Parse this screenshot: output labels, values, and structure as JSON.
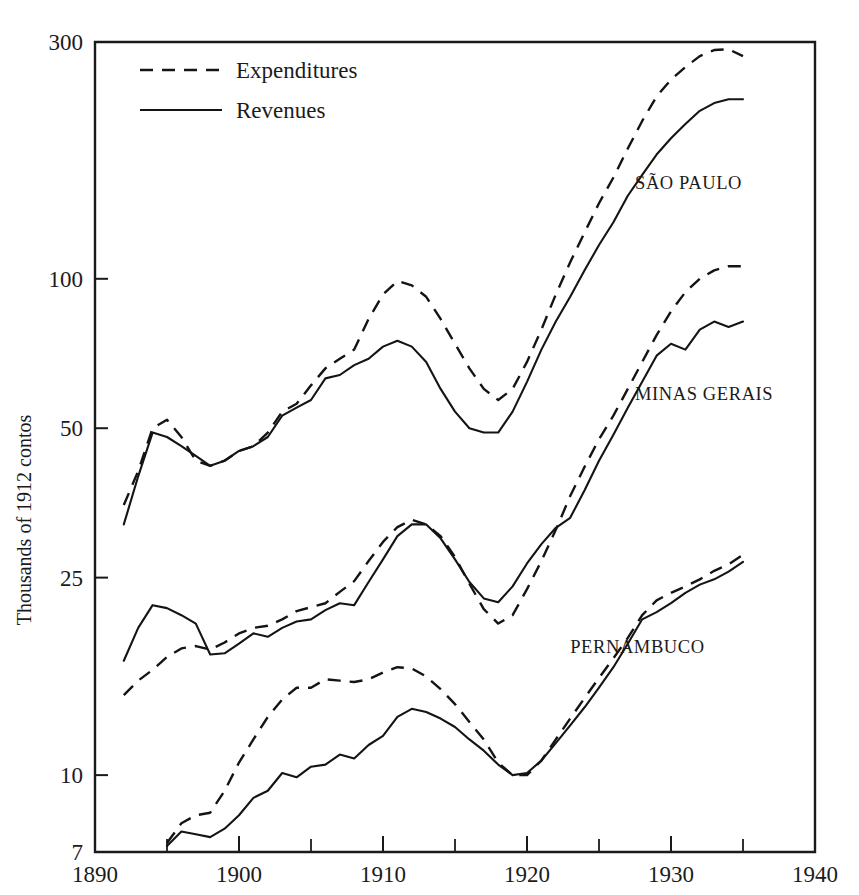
{
  "chart_data": {
    "type": "line",
    "title": "",
    "xlabel": "",
    "ylabel": "Thousands of 1912 contos",
    "xlim": [
      1890,
      1940
    ],
    "ylim": [
      7,
      300
    ],
    "yscale": "log",
    "grid": false,
    "legend_position": "top-left inside",
    "x_ticks": [
      "1890",
      "1900",
      "1910",
      "1920",
      "1930",
      "1940"
    ],
    "x_tick_values": [
      1890,
      1900,
      1910,
      1920,
      1930,
      1940
    ],
    "x_minor_tick_values": [
      1895,
      1905,
      1915,
      1925,
      1935
    ],
    "y_ticks": [
      "300",
      "100",
      "50",
      "25",
      "10",
      "7"
    ],
    "y_tick_values": [
      300,
      100,
      50,
      25,
      10,
      7
    ],
    "legend": [
      {
        "label": "Expenditures",
        "style": "dashed"
      },
      {
        "label": "Revenues",
        "style": "solid"
      }
    ],
    "group_labels": [
      {
        "text": "SÃO PAULO",
        "x": 1927.5,
        "y": 152
      },
      {
        "text": "MINAS GERAIS",
        "x": 1927.5,
        "y": 57
      },
      {
        "text": "PERNAMBUCO",
        "x": 1923.0,
        "y": 17.6
      }
    ],
    "series": [
      {
        "name": "SÃO PAULO Expenditures",
        "group": "SÃO PAULO",
        "style": "dashed",
        "x": [
          1892,
          1893,
          1894,
          1895,
          1896,
          1897,
          1898,
          1899,
          1900,
          1901,
          1902,
          1903,
          1904,
          1905,
          1906,
          1907,
          1908,
          1909,
          1910,
          1911,
          1912,
          1913,
          1914,
          1915,
          1916,
          1917,
          1918,
          1919,
          1920,
          1921,
          1922,
          1923,
          1924,
          1925,
          1926,
          1927,
          1928,
          1929,
          1930,
          1931,
          1932,
          1933,
          1934,
          1935
        ],
        "y": [
          35,
          41,
          50,
          52,
          48,
          43,
          42,
          43,
          45,
          46,
          49,
          54,
          56,
          61,
          66,
          69,
          72,
          83,
          93,
          99,
          97,
          92,
          83,
          74,
          66,
          60,
          57,
          60,
          68,
          79,
          93,
          108,
          124,
          142,
          160,
          183,
          208,
          233,
          252,
          267,
          281,
          289,
          290,
          281
        ],
        "notes": "Top band, dashed. Peak ~99 in 1911, trough ~57 in 1918, peak ~290 in 1934."
      },
      {
        "name": "SÃO PAULO Revenues",
        "group": "SÃO PAULO",
        "style": "solid",
        "x": [
          1892,
          1893,
          1894,
          1895,
          1896,
          1897,
          1898,
          1899,
          1900,
          1901,
          1902,
          1903,
          1904,
          1905,
          1906,
          1907,
          1908,
          1909,
          1910,
          1911,
          1912,
          1913,
          1914,
          1915,
          1916,
          1917,
          1918,
          1919,
          1920,
          1921,
          1922,
          1923,
          1924,
          1925,
          1926,
          1927,
          1928,
          1929,
          1930,
          1931,
          1932,
          1933,
          1934,
          1935
        ],
        "y": [
          32,
          40,
          49,
          48,
          46,
          44,
          42,
          43,
          45,
          46,
          48,
          53,
          55,
          57,
          63,
          64,
          67,
          69,
          73,
          75,
          73,
          68,
          60,
          54,
          50,
          49,
          49,
          54,
          62,
          72,
          82,
          92,
          104,
          117,
          130,
          147,
          162,
          178,
          192,
          205,
          218,
          226,
          230,
          230
        ],
        "notes": "Top band, solid. Peak ~75 in 1911, trough ~49 in 1917-1918, ends ~230."
      },
      {
        "name": "MINAS GERAIS Expenditures",
        "group": "MINAS GERAIS",
        "style": "dashed",
        "x": [
          1892,
          1893,
          1894,
          1895,
          1896,
          1897,
          1898,
          1899,
          1900,
          1901,
          1902,
          1903,
          1904,
          1905,
          1906,
          1907,
          1908,
          1909,
          1910,
          1911,
          1912,
          1913,
          1914,
          1915,
          1916,
          1917,
          1918,
          1919,
          1920,
          1921,
          1922,
          1923,
          1924,
          1925,
          1926,
          1927,
          1928,
          1929,
          1930,
          1931,
          1932,
          1933,
          1934,
          1935
        ],
        "y": [
          14.5,
          15.5,
          16.3,
          17.3,
          18.0,
          18.2,
          17.9,
          18.5,
          19.3,
          19.8,
          20.0,
          20.6,
          21.4,
          21.8,
          22.2,
          23.4,
          24.6,
          27.0,
          29.5,
          31.6,
          32.7,
          32.0,
          30.3,
          27.5,
          24.3,
          21.6,
          20.2,
          21.0,
          23.7,
          27.0,
          31.2,
          36.5,
          41.8,
          47.5,
          53.0,
          60.0,
          68.0,
          77.0,
          86.0,
          94.0,
          100.0,
          104.0,
          106.0,
          106.0
        ],
        "notes": "Middle band, dashed. Peak ~32.7 in 1912, trough ~20 in 1918, plateau ~106 in 1934-35."
      },
      {
        "name": "MINAS GERAIS Revenues",
        "group": "MINAS GERAIS",
        "style": "solid",
        "x": [
          1892,
          1893,
          1894,
          1895,
          1896,
          1897,
          1898,
          1899,
          1900,
          1901,
          1902,
          1903,
          1904,
          1905,
          1906,
          1907,
          1908,
          1909,
          1910,
          1911,
          1912,
          1913,
          1914,
          1915,
          1916,
          1917,
          1918,
          1919,
          1920,
          1921,
          1922,
          1923,
          1924,
          1925,
          1926,
          1927,
          1928,
          1929,
          1930,
          1931,
          1932,
          1933,
          1934,
          1935
        ],
        "y": [
          17.0,
          19.8,
          22.0,
          21.7,
          21.0,
          20.2,
          17.5,
          17.6,
          18.4,
          19.3,
          19.0,
          19.8,
          20.4,
          20.6,
          21.5,
          22.2,
          22.0,
          24.5,
          27.2,
          30.3,
          32.0,
          32.0,
          30.0,
          27.2,
          24.5,
          22.7,
          22.3,
          24.0,
          26.7,
          29.2,
          31.5,
          33.0,
          37.5,
          43.0,
          48.5,
          55.0,
          62.0,
          70.0,
          74.0,
          72.0,
          79.0,
          82.0,
          80.0,
          82.0
        ],
        "notes": "Middle band, solid. Early peak ~22 in 1894, peak ~32 in 1912-1913, trough ~22.3 in 1918."
      },
      {
        "name": "PERNAMBUCO Expenditures",
        "group": "PERNAMBUCO",
        "style": "dashed",
        "x": [
          1895,
          1896,
          1897,
          1898,
          1899,
          1900,
          1901,
          1902,
          1903,
          1904,
          1905,
          1906,
          1907,
          1908,
          1909,
          1910,
          1911,
          1912,
          1913,
          1914,
          1915,
          1916,
          1917,
          1918,
          1919,
          1920,
          1921,
          1922,
          1923,
          1924,
          1925,
          1926,
          1927,
          1928,
          1929,
          1930,
          1931,
          1932,
          1933,
          1934,
          1935
        ],
        "y": [
          7.3,
          8.0,
          8.3,
          8.4,
          9.3,
          10.6,
          11.8,
          13.1,
          14.2,
          15.0,
          15.0,
          15.6,
          15.5,
          15.4,
          15.6,
          16.1,
          16.5,
          16.4,
          15.8,
          14.9,
          13.9,
          12.8,
          11.8,
          10.6,
          10.0,
          10.0,
          10.7,
          11.8,
          13.0,
          14.3,
          15.7,
          17.2,
          18.9,
          21.0,
          22.5,
          23.3,
          24.0,
          24.8,
          25.8,
          26.6,
          27.8
        ],
        "notes": "Bottom band, dashed. Peak ~16.5 in 1911, trough ~10 in 1919-1920, ends ~27.8."
      },
      {
        "name": "PERNAMBUCO Revenues",
        "group": "PERNAMBUCO",
        "style": "solid",
        "x": [
          1895,
          1896,
          1897,
          1898,
          1899,
          1900,
          1901,
          1902,
          1903,
          1904,
          1905,
          1906,
          1907,
          1908,
          1909,
          1910,
          1911,
          1912,
          1913,
          1914,
          1915,
          1916,
          1917,
          1918,
          1919,
          1920,
          1921,
          1922,
          1923,
          1924,
          1925,
          1926,
          1927,
          1928,
          1929,
          1930,
          1931,
          1932,
          1933,
          1934,
          1935
        ],
        "y": [
          7.2,
          7.7,
          7.6,
          7.5,
          7.8,
          8.3,
          9.0,
          9.3,
          10.1,
          9.9,
          10.4,
          10.5,
          11.0,
          10.8,
          11.5,
          12.0,
          13.1,
          13.6,
          13.4,
          13.0,
          12.5,
          11.8,
          11.2,
          10.5,
          10.0,
          10.1,
          10.7,
          11.6,
          12.6,
          13.7,
          15.0,
          16.5,
          18.4,
          20.6,
          21.3,
          22.2,
          23.3,
          24.2,
          24.8,
          25.7,
          26.9
        ],
        "notes": "Bottom band, solid. Peak ~13.6 in 1912, trough ~10 in 1919, ends ~26.9."
      }
    ]
  }
}
